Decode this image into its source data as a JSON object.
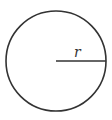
{
  "diagram": {
    "type": "circle-with-radius",
    "circle": {
      "cx": 56,
      "cy": 61,
      "r": 50,
      "stroke": "#333333",
      "stroke_width": 1.6,
      "fill": "#ffffff"
    },
    "radius_line": {
      "x1": 56,
      "y1": 61,
      "x2": 106,
      "y2": 61,
      "stroke": "#333333",
      "stroke_width": 1.6
    },
    "label": {
      "text": "r",
      "x": 74,
      "y": 57
    }
  }
}
